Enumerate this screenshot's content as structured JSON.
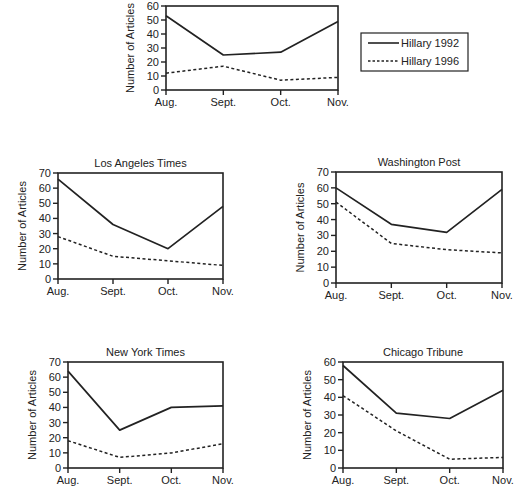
{
  "legend": {
    "items": [
      {
        "label": "Hillary 1992",
        "style": "solid"
      },
      {
        "label": "Hillary 1996",
        "style": "dashed"
      }
    ]
  },
  "chart_data": [
    {
      "id": "overall",
      "type": "line",
      "title": "",
      "xlabel": "",
      "ylabel": "Number of Articles",
      "categories": [
        "Aug.",
        "Sept.",
        "Oct.",
        "Nov."
      ],
      "ylim": [
        0,
        60
      ],
      "yticks": [
        0,
        10,
        20,
        30,
        40,
        50,
        60
      ],
      "grid": false,
      "legend_position": "right",
      "series": [
        {
          "name": "Hillary 1992",
          "values": [
            53,
            25,
            27,
            49
          ]
        },
        {
          "name": "Hillary 1996",
          "values": [
            12,
            17,
            7,
            9
          ]
        }
      ],
      "frame": {
        "x0": 166,
        "x1": 338,
        "y0": 6,
        "y1": 90
      }
    },
    {
      "id": "la-times",
      "type": "line",
      "title": "Los Angeles Times",
      "xlabel": "",
      "ylabel": "Number of Articles",
      "categories": [
        "Aug.",
        "Sept.",
        "Oct.",
        "Nov."
      ],
      "ylim": [
        0,
        70
      ],
      "yticks": [
        0,
        10,
        20,
        30,
        40,
        50,
        60,
        70
      ],
      "grid": false,
      "series": [
        {
          "name": "Hillary 1992",
          "values": [
            66,
            36,
            20,
            48
          ]
        },
        {
          "name": "Hillary 1996",
          "values": [
            28,
            15,
            12,
            9
          ]
        }
      ],
      "frame": {
        "x0": 58,
        "x1": 223,
        "y0": 173,
        "y1": 279
      }
    },
    {
      "id": "washington-post",
      "type": "line",
      "title": "Washington Post",
      "xlabel": "",
      "ylabel": "Number of Articles",
      "categories": [
        "Aug.",
        "Sept.",
        "Oct.",
        "Nov."
      ],
      "ylim": [
        0,
        70
      ],
      "yticks": [
        0,
        10,
        20,
        30,
        40,
        50,
        60,
        70
      ],
      "grid": false,
      "series": [
        {
          "name": "Hillary 1992",
          "values": [
            60,
            37,
            32,
            59
          ]
        },
        {
          "name": "Hillary 1996",
          "values": [
            51,
            25,
            21,
            19
          ]
        }
      ],
      "frame": {
        "x0": 336,
        "x1": 502,
        "y0": 172,
        "y1": 283
      }
    },
    {
      "id": "new-york-times",
      "type": "line",
      "title": "New York Times",
      "xlabel": "",
      "ylabel": "Number of Articles",
      "categories": [
        "Aug.",
        "Sept.",
        "Oct.",
        "Nov."
      ],
      "ylim": [
        0,
        70
      ],
      "yticks": [
        0,
        10,
        20,
        30,
        40,
        50,
        60,
        70
      ],
      "grid": false,
      "series": [
        {
          "name": "Hillary 1992",
          "values": [
            64,
            25,
            40,
            41
          ]
        },
        {
          "name": "Hillary 1996",
          "values": [
            18,
            7,
            10,
            16
          ]
        }
      ],
      "frame": {
        "x0": 68,
        "x1": 223,
        "y0": 362,
        "y1": 468
      }
    },
    {
      "id": "chicago-tribune",
      "type": "line",
      "title": "Chicago Tribune",
      "xlabel": "",
      "ylabel": "Number of Articles",
      "categories": [
        "Aug.",
        "Sept.",
        "Oct.",
        "Nov."
      ],
      "ylim": [
        0,
        60
      ],
      "yticks": [
        0,
        10,
        20,
        30,
        40,
        50,
        60
      ],
      "grid": false,
      "series": [
        {
          "name": "Hillary 1992",
          "values": [
            58,
            31,
            28,
            44
          ]
        },
        {
          "name": "Hillary 1996",
          "values": [
            41,
            21,
            5,
            6
          ]
        }
      ],
      "frame": {
        "x0": 343,
        "x1": 503,
        "y0": 362,
        "y1": 468
      }
    }
  ]
}
